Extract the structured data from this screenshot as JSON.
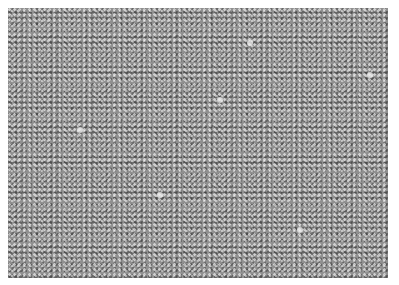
{
  "image": {
    "description": "Grayscale phase-contrast micrograph of a dense confluent cell monolayer",
    "border_color": "#ffffff",
    "tone": "#8f8f8f",
    "bright_spots": [
      {
        "x": 250,
        "y": 43
      },
      {
        "x": 370,
        "y": 75
      },
      {
        "x": 160,
        "y": 195
      },
      {
        "x": 80,
        "y": 130
      },
      {
        "x": 300,
        "y": 230
      },
      {
        "x": 220,
        "y": 100
      }
    ]
  }
}
